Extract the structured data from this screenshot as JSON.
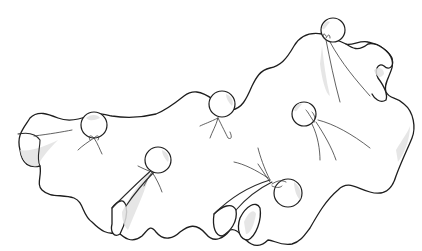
{
  "illustration": {
    "subject": "cloth with balls tied into it",
    "style": "pencil line drawing with light gray shading",
    "ball_count": 6,
    "colors": {
      "background": "#ffffff",
      "line": "#1e1e1e",
      "shading": "#e2e2e2"
    }
  }
}
